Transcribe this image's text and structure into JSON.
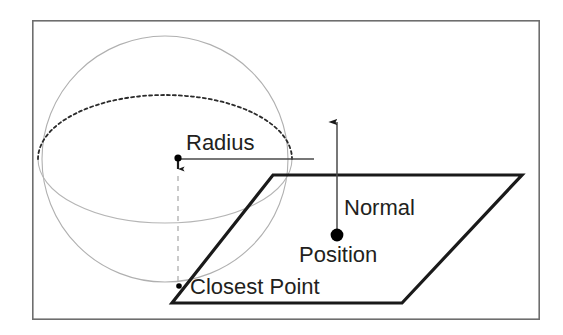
{
  "figure": {
    "background_color": "#ffffff",
    "frame": {
      "name": "figure-border",
      "x": 32,
      "y": 20,
      "width": 508,
      "height": 300,
      "stroke_color": "#6e6e6e",
      "stroke_width": 1.6
    }
  },
  "labels": {
    "radius": "Radius",
    "normal": "Normal",
    "position": "Position",
    "closest_point": "Closest Point"
  },
  "colors": {
    "sphere_outline": "#b0b0b0",
    "equator_dashed": "#2b2b2b",
    "equator_solid": "#b5b5b5",
    "plane_stroke": "#1a1a1a",
    "radius_line": "#4a4a4a",
    "drop_line": "#b9b9b9",
    "normal_line": "#4a4a4a",
    "dot_fill": "#000000",
    "text": "#231f20"
  },
  "geometry": {
    "sphere": {
      "name": "sphere-outline",
      "cx": 165,
      "cy": 159,
      "r": 123,
      "stroke_width": 1.1
    },
    "equator": {
      "name": "sphere-equator-ellipse",
      "cx": 165,
      "cy": 159,
      "rx": 127,
      "ry": 64,
      "upper_dash": "3 3",
      "stroke_width_upper": 1.7,
      "stroke_width_lower": 1.1
    },
    "plane": {
      "name": "plane-parallelogram",
      "points": "273,175 522,175 402,303 172,303",
      "stroke_width": 3.2
    },
    "radius_line": {
      "name": "radius-measure-line",
      "x1": 178,
      "y1": 159,
      "x2": 314,
      "y2": 159,
      "stroke_width": 1.4
    },
    "center_dot": {
      "name": "sphere-center-dot",
      "cx": 178,
      "cy": 158,
      "r": 3.4
    },
    "center_tick_arrow": {
      "name": "sphere-center-down-tick",
      "x": 178,
      "y1": 161,
      "y2": 174
    },
    "drop_line": {
      "name": "center-to-closest-point-dashed-line",
      "x": 178,
      "y1": 175,
      "y2": 284,
      "dash": "5 5",
      "stroke_width": 1.4
    },
    "closest_point_dot": {
      "name": "closest-point-dot",
      "cx": 179,
      "cy": 286,
      "r": 2.6
    },
    "position_dot": {
      "name": "position-dot",
      "cx": 337,
      "cy": 235,
      "r": 6.2
    },
    "normal_arrow": {
      "name": "normal-vector-arrow",
      "x": 337,
      "y_tail": 232,
      "y_head": 114,
      "stroke_width": 1.4
    }
  },
  "label_positions": {
    "radius": {
      "x": 186,
      "y": 150,
      "size": 22
    },
    "normal": {
      "x": 344,
      "y": 215,
      "size": 22
    },
    "position": {
      "x": 298,
      "y": 262,
      "size": 22
    },
    "closest_point": {
      "x": 190,
      "y": 294,
      "size": 22
    }
  }
}
